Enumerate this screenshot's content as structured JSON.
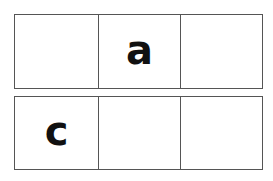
{
  "grid": {
    "rows": [
      {
        "cells": [
          "",
          "a",
          ""
        ]
      },
      {
        "cells": [
          "c",
          "",
          ""
        ]
      }
    ]
  },
  "colors": {
    "border": "#555555",
    "text": "#111111",
    "background": "#ffffff"
  }
}
